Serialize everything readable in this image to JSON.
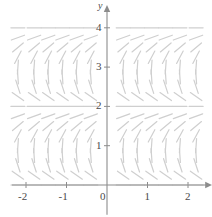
{
  "figure": {
    "type": "slope-field",
    "background_color": "#ffffff",
    "axis_color": "#8c8c8c",
    "tick_label_color": "#4a4a4a",
    "segment_color": "#cfcfcf",
    "width": 212,
    "height": 217
  },
  "axes": {
    "x": {
      "name": "x",
      "tick_labels": [
        "-2",
        "-1",
        "0",
        "1",
        "2"
      ],
      "tick_values": [
        -2,
        -1,
        0,
        1,
        2
      ],
      "range": [
        -2.35,
        2.35
      ],
      "has_arrow": true
    },
    "y": {
      "name": "y",
      "tick_labels": [
        "1",
        "2",
        "3",
        "4"
      ],
      "tick_values": [
        1,
        2,
        3,
        4
      ],
      "origin_label": "0",
      "range": [
        -0.25,
        4.45
      ],
      "has_arrow": true
    }
  },
  "chart_data": {
    "type": "scatter",
    "title": "",
    "xlabel": "x",
    "ylabel": "y",
    "xlim": [
      -2.35,
      2.35
    ],
    "ylim": [
      -0.25,
      4.45
    ],
    "grid": false,
    "legend": null,
    "x_sample_points": [
      -2.2,
      -1.8,
      -1.45,
      -1.1,
      -0.75,
      -0.4,
      0.4,
      0.75,
      1.1,
      1.45,
      1.8,
      2.2
    ],
    "y_sample_points": [
      0.0,
      0.25,
      0.5,
      0.75,
      1.0,
      1.25,
      1.5,
      1.75,
      2.0,
      2.25,
      2.5,
      2.75,
      3.0,
      3.25,
      3.5,
      3.75,
      4.0
    ],
    "slope_angles_deg_by_y": [
      {
        "y": 0.0,
        "angle": 0
      },
      {
        "y": 0.25,
        "angle": -35
      },
      {
        "y": 0.5,
        "angle": -72
      },
      {
        "y": 0.75,
        "angle": -86
      },
      {
        "y": 1.0,
        "angle": 86
      },
      {
        "y": 1.25,
        "angle": 62
      },
      {
        "y": 1.5,
        "angle": 40
      },
      {
        "y": 1.75,
        "angle": 20
      },
      {
        "y": 2.0,
        "angle": 0
      },
      {
        "y": 2.25,
        "angle": -35
      },
      {
        "y": 2.5,
        "angle": -72
      },
      {
        "y": 2.75,
        "angle": -86
      },
      {
        "y": 3.0,
        "angle": 86
      },
      {
        "y": 3.25,
        "angle": 62
      },
      {
        "y": 3.5,
        "angle": 40
      },
      {
        "y": 3.75,
        "angle": 20
      },
      {
        "y": 4.0,
        "angle": 0
      }
    ]
  }
}
